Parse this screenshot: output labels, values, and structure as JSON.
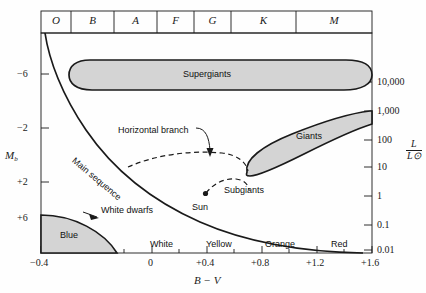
{
  "figure": {
    "kind": "hertzsprung-russell-diagram",
    "background_color": "#fefefe",
    "line_color": "#1a1a1a",
    "region_fill": "#d4d4d4"
  },
  "spectral_classes": {
    "name": "spectral-class-header",
    "items": [
      {
        "label": "O",
        "x0": 41,
        "x1": 71
      },
      {
        "label": "B",
        "x0": 71,
        "x1": 114
      },
      {
        "label": "A",
        "x0": 114,
        "x1": 157
      },
      {
        "label": "F",
        "x0": 157,
        "x1": 194
      },
      {
        "label": "G",
        "x0": 194,
        "x1": 231
      },
      {
        "label": "K",
        "x0": 231,
        "x1": 296
      },
      {
        "label": "M",
        "x0": 296,
        "x1": 372
      }
    ]
  },
  "left_axis": {
    "title": "M",
    "title_sub": "b",
    "ticks": [
      {
        "label": "−6",
        "y": 74
      },
      {
        "label": "−2",
        "y": 128
      },
      {
        "label": "+2",
        "y": 182
      },
      {
        "label": "+6",
        "y": 218
      }
    ]
  },
  "right_axis": {
    "title_num": "L",
    "title_den": "L⊙",
    "ticks": [
      {
        "label": "10,000",
        "y": 82
      },
      {
        "label": "1,000",
        "y": 111
      },
      {
        "label": "100",
        "y": 140
      },
      {
        "label": "10",
        "y": 167
      },
      {
        "label": "1",
        "y": 196
      },
      {
        "label": "0.1",
        "y": 225
      },
      {
        "label": "0.01",
        "y": 250
      }
    ]
  },
  "bottom_axis": {
    "title": "B − V",
    "ticks": [
      {
        "label": "−0.4",
        "x": 41
      },
      {
        "label": "0",
        "x": 152
      },
      {
        "label": "+0.4",
        "x": 207
      },
      {
        "label": "+0.8",
        "x": 262
      },
      {
        "label": "+1.2",
        "x": 317
      },
      {
        "label": "+1.6",
        "x": 372
      }
    ],
    "minor_tick_x": [
      69,
      96,
      124,
      179,
      234,
      289,
      344
    ],
    "color_bands": [
      {
        "label": "Blue",
        "x": 70
      },
      {
        "label": "White",
        "x": 165
      },
      {
        "label": "Yellow",
        "x": 222
      },
      {
        "label": "Orange",
        "x": 281
      },
      {
        "label": "Red",
        "x": 340
      }
    ]
  },
  "regions": [
    {
      "name": "supergiants",
      "label": "Supergiants",
      "label_x": 208,
      "label_y": 74
    },
    {
      "name": "giants",
      "label": "Giants",
      "label_x": 312,
      "label_y": 137
    },
    {
      "name": "white-dwarfs",
      "label": "White dwarfs",
      "label_x": 83,
      "label_y": 211
    }
  ],
  "annotations": [
    {
      "name": "horizontal-branch",
      "label": "Horizontal branch",
      "label_x": 118,
      "label_y": 131
    },
    {
      "name": "main-sequence",
      "label": "Main  sequence",
      "label_x": 73,
      "label_y": 155,
      "rotation": 40
    },
    {
      "name": "subgiants",
      "label": "Subgiants",
      "label_x": 247,
      "label_y": 190
    },
    {
      "name": "sun",
      "label": "Sun",
      "label_x": 192,
      "label_y": 203
    }
  ],
  "plot_frame": {
    "left": 41,
    "top": 33,
    "right": 372,
    "bottom": 253
  }
}
